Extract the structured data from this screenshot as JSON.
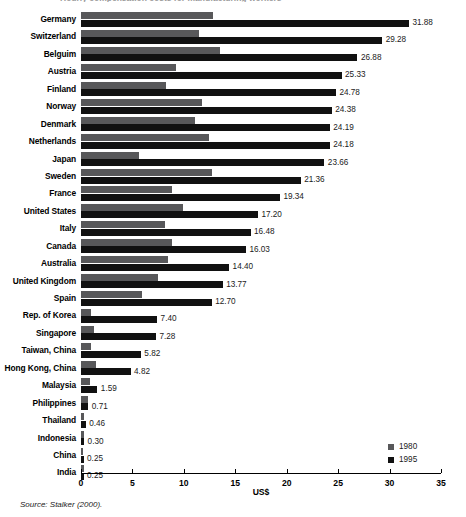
{
  "figure": {
    "clipped_title": "Hourly compensation costs for manufacturing workers",
    "source_note": "Source: Stalker (2000)."
  },
  "chart_data": {
    "type": "bar",
    "orientation": "horizontal",
    "title": "",
    "xlabel": "US$",
    "ylabel": "",
    "xlim": [
      0,
      35
    ],
    "xticks": [
      0,
      5,
      10,
      15,
      20,
      25,
      30,
      35
    ],
    "grid": false,
    "legend_position": "bottom-right",
    "categories": [
      "Germany",
      "Switzerland",
      "Belguim",
      "Austria",
      "Finland",
      "Norway",
      "Denmark",
      "Netherlands",
      "Japan",
      "Sweden",
      "France",
      "United States",
      "Italy",
      "Canada",
      "Australia",
      "United Kingdom",
      "Spain",
      "Rep. of Korea",
      "Singapore",
      "Taiwan, China",
      "Hong Kong, China",
      "Malaysia",
      "Philippines",
      "Thailand",
      "Indonesia",
      "China",
      "India"
    ],
    "series": [
      {
        "name": "1980",
        "color": "#58585a",
        "values": [
          12.8,
          11.5,
          13.5,
          9.2,
          8.3,
          11.8,
          11.1,
          12.4,
          5.6,
          12.7,
          8.8,
          9.9,
          8.2,
          8.8,
          8.5,
          7.5,
          5.9,
          1.0,
          1.3,
          1.0,
          1.5,
          0.9,
          0.7,
          0.3,
          0.25,
          0.2,
          0.25
        ]
      },
      {
        "name": "1995",
        "color": "#111111",
        "values": [
          31.88,
          29.28,
          26.88,
          25.33,
          24.78,
          24.38,
          24.19,
          24.18,
          23.66,
          21.36,
          19.34,
          17.2,
          16.48,
          16.03,
          14.4,
          13.77,
          12.7,
          7.4,
          7.28,
          5.82,
          4.82,
          1.59,
          0.71,
          0.46,
          0.3,
          0.25,
          0.25
        ]
      }
    ],
    "value_labels": [
      "31.88",
      "29.28",
      "26.88",
      "25.33",
      "24.78",
      "24.38",
      "24.19",
      "24.18",
      "23.66",
      "21.36",
      "19.34",
      "17.20",
      "16.48",
      "16.03",
      "14.40",
      "13.77",
      "12.70",
      "7.40",
      "7.28",
      "5.82",
      "4.82",
      "1.59",
      "0.71",
      "0.46",
      "0.30",
      "0.25",
      "0.25"
    ]
  }
}
